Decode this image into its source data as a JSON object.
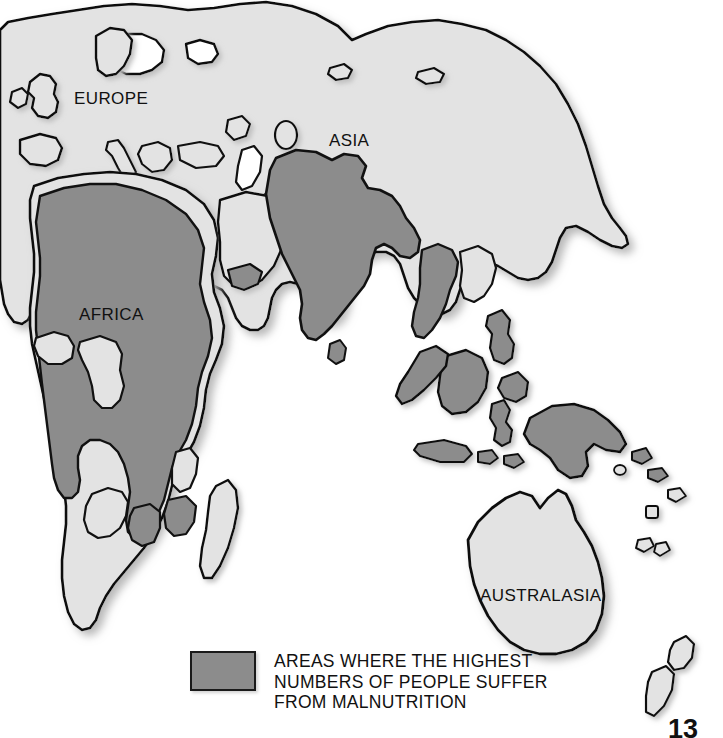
{
  "map": {
    "title": "World map of malnutrition",
    "projection_note": "Eastern Hemisphere world map",
    "ocean_color": "#ffffff",
    "land_color": "#e3e3e3",
    "highlight_color": "#8c8c8c",
    "outline_color": "#111111",
    "shadow_color": "#c9c9c9",
    "region_labels": [
      {
        "name": "EUROPE",
        "x": 74,
        "y": 89,
        "fill": "land"
      },
      {
        "name": "ASIA",
        "x": 329,
        "y": 131,
        "fill": "land"
      },
      {
        "name": "AFRICA",
        "x": 79,
        "y": 305,
        "fill": "highlight"
      },
      {
        "name": "AUSTRALASIA",
        "x": 480,
        "y": 586,
        "fill": "land"
      }
    ]
  },
  "legend": {
    "swatch_color": "#8c8c8c",
    "swatch_border": "#1a1a1a",
    "lines": [
      "AREAS WHERE THE HIGHEST",
      "NUMBERS OF PEOPLE SUFFER",
      "FROM MALNUTRITION"
    ],
    "caption": "AREAS WHERE THE HIGHEST NUMBERS OF PEOPLE SUFFER FROM MALNUTRITION"
  },
  "page": {
    "number": "13"
  }
}
